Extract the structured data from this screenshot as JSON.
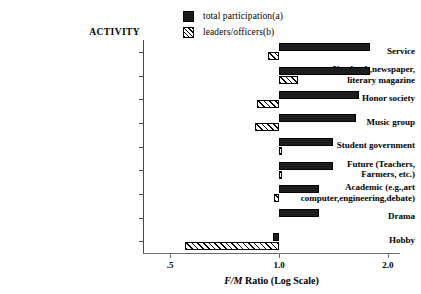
{
  "chart_data": {
    "type": "bar",
    "orientation": "horizontal",
    "title": "",
    "xlabel": "F/M Ratio (Log Scale)",
    "ylabel": "ACTIVITY",
    "xscale": "log",
    "xlim": [
      0.45,
      2.2
    ],
    "xticks": [
      0.5,
      1.0,
      2.0
    ],
    "xticklabels": [
      ".5",
      "1.0",
      "2.0"
    ],
    "grid": false,
    "reference_line": 1.0,
    "legend_position": "top-center",
    "categories": [
      "Service",
      "Yearbook,newspaper,\nliterary magazine",
      "Honor society",
      "Music group",
      "Student government",
      "Future (Teachers,\nFarmers, etc.)",
      "Academic (e.g.,art\ncomputer,engineering,debate)",
      "Drama",
      "Hobby"
    ],
    "series": [
      {
        "name": "total participation(a)",
        "pattern": "solid",
        "color": "#1d1d1d",
        "values": [
          1.78,
          1.78,
          1.66,
          1.63,
          1.41,
          1.41,
          1.29,
          1.29,
          0.96
        ]
      },
      {
        "name": "leaders/officers(b)",
        "pattern": "hatched",
        "color": "#ffffff",
        "values": [
          0.93,
          1.13,
          0.87,
          0.86,
          1.02,
          1.02,
          0.97,
          null,
          0.55
        ]
      }
    ]
  },
  "legend": {
    "items": [
      {
        "label": "total participation(a)",
        "swatch": "solid-square"
      },
      {
        "label": "leaders/officers(b)",
        "swatch": "hatched-square"
      }
    ]
  },
  "axis": {
    "activity_header": "ACTIVITY",
    "x_title_italic": "F/M",
    "x_title_rest": " Ratio (Log Scale)"
  }
}
